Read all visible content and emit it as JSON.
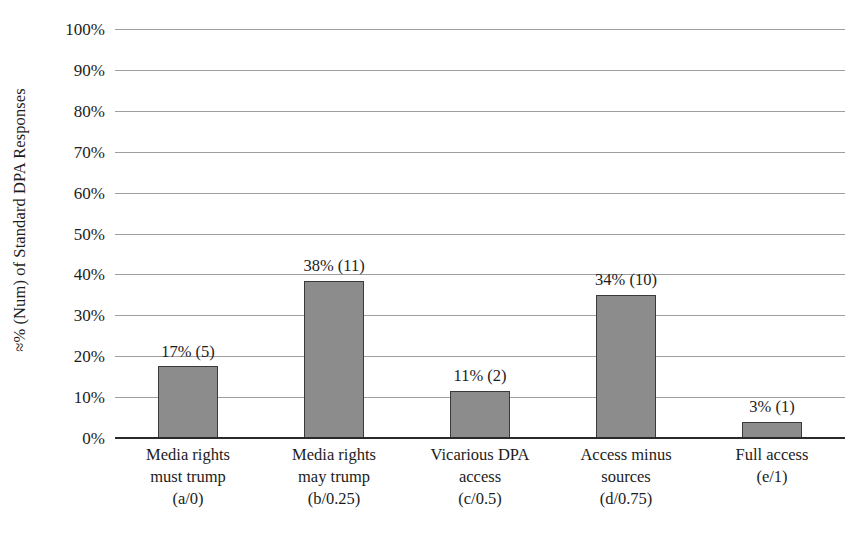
{
  "chart_data": {
    "type": "bar",
    "title": "",
    "xlabel": "",
    "ylabel": "≈% (Num) of Standard DPA Responses",
    "ylim": [
      0,
      100
    ],
    "ytick_labels": [
      "100%",
      "90%",
      "80%",
      "70%",
      "60%",
      "50%",
      "40%",
      "30%",
      "20%",
      "10%",
      "0%"
    ],
    "ytick_values": [
      100,
      90,
      80,
      70,
      60,
      50,
      40,
      30,
      20,
      10,
      0
    ],
    "grid": true,
    "legend": "none",
    "categories": [
      "Media rights must trump (a/0)",
      "Media rights may trump (b/0.25)",
      "Vicarious DPA access (c/0.5)",
      "Access minus sources (d/0.75)",
      "Full access (e/1)"
    ],
    "category_lines": [
      [
        "Media rights",
        "must trump",
        "(a/0)"
      ],
      [
        "Media rights",
        "may trump",
        "(b/0.25)"
      ],
      [
        "Vicarious DPA",
        "access",
        "(c/0.5)"
      ],
      [
        "Access minus",
        "sources",
        "(d/0.75)"
      ],
      [
        "Full access",
        "(e/1)"
      ]
    ],
    "values": [
      17,
      38,
      11,
      34,
      3
    ],
    "counts": [
      5,
      11,
      2,
      10,
      1
    ],
    "drawn_values": [
      17.5,
      38.5,
      11.5,
      35,
      4
    ],
    "data_labels": [
      "17% (5)",
      "38% (11)",
      "11% (2)",
      "34% (10)",
      "3% (1)"
    ],
    "bar_color": "#8c8c8c",
    "bar_border_color": "#3a3a3a",
    "gridline_color": "#8e8e8e",
    "axis_color": "#2a2a2a",
    "background_color": "#ffffff"
  }
}
